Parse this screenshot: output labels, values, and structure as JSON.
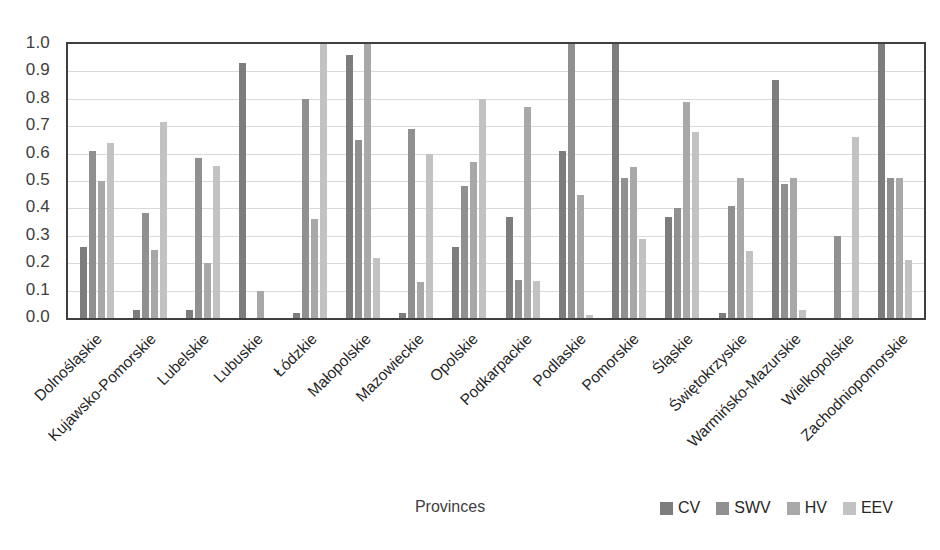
{
  "chart_data": {
    "type": "bar",
    "title": "",
    "xlabel": "Provinces",
    "ylabel": "",
    "ylim": [
      0.0,
      1.0
    ],
    "grid": true,
    "legend_position": "bottom-right",
    "y_ticks": [
      "0.0",
      "0.1",
      "0.2",
      "0.3",
      "0.4",
      "0.5",
      "0.6",
      "0.7",
      "0.8",
      "0.9",
      "1.0"
    ],
    "y_tick_values": [
      0.0,
      0.1,
      0.2,
      0.3,
      0.4,
      0.5,
      0.6,
      0.7,
      0.8,
      0.9,
      1.0
    ],
    "categories": [
      "Dolnośląskie",
      "Kujawsko-Pomorskie",
      "Lubelskie",
      "Lubuskie",
      "Łódzkie",
      "Małopolskie",
      "Mazowieckie",
      "Opolskie",
      "Podkarpackie",
      "Podlaskie",
      "Pomorskie",
      "Śląskie",
      "Świętokrzyskie",
      "Warmińsko-Mazurskie",
      "Wielkopolskie",
      "Zachodniopomorskie"
    ],
    "series": [
      {
        "name": "CV",
        "color": "#7d7d7d",
        "values": [
          0.26,
          0.03,
          0.03,
          0.93,
          0.02,
          0.96,
          0.02,
          0.26,
          0.37,
          0.61,
          1.0,
          0.37,
          0.02,
          0.87,
          0.0,
          1.0
        ]
      },
      {
        "name": "SWV",
        "color": "#909090",
        "values": [
          0.61,
          0.385,
          0.585,
          0.0,
          0.8,
          0.65,
          0.69,
          0.48,
          0.14,
          1.0,
          0.51,
          0.4,
          0.41,
          0.49,
          0.3,
          0.51
        ]
      },
      {
        "name": "HV",
        "color": "#a8a8a8",
        "values": [
          0.5,
          0.25,
          0.2,
          0.1,
          0.36,
          1.0,
          0.13,
          0.57,
          0.77,
          0.45,
          0.55,
          0.79,
          0.51,
          0.51,
          0.0,
          0.51
        ]
      },
      {
        "name": "EEV",
        "color": "#c2c2c2",
        "values": [
          0.64,
          0.715,
          0.555,
          0.0,
          1.0,
          0.22,
          0.6,
          0.8,
          0.135,
          0.01,
          0.29,
          0.68,
          0.245,
          0.03,
          0.66,
          0.21
        ]
      }
    ]
  },
  "legend": {
    "items": [
      {
        "label": "CV",
        "color": "#7d7d7d"
      },
      {
        "label": "SWV",
        "color": "#909090"
      },
      {
        "label": "HV",
        "color": "#a8a8a8"
      },
      {
        "label": "EEV",
        "color": "#c2c2c2"
      }
    ]
  },
  "axis": {
    "x_title": "Provinces"
  },
  "style": {
    "plot_border_color": "#3f3f3f",
    "gridline_color": "#d9d9d9",
    "background": "#ffffff",
    "tick_text_color": "#404040",
    "label_text_color": "#262626"
  }
}
